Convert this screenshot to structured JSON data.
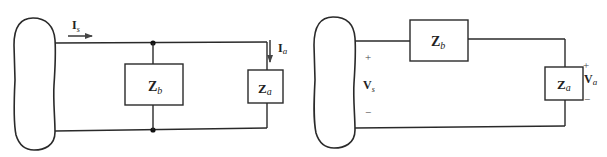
{
  "diagrams": [
    {
      "id": "parallel",
      "description": "Source network with parallel impedances Zb and Za",
      "components": {
        "zb": {
          "main": "Z",
          "sub": "b"
        },
        "za": {
          "main": "Z",
          "sub": "a"
        }
      },
      "currents": {
        "source": {
          "main": "I",
          "sub": "s"
        },
        "load": {
          "main": "I",
          "sub": "a"
        }
      }
    },
    {
      "id": "series",
      "description": "Source network with series impedance Zb and load Za",
      "components": {
        "zb": {
          "main": "Z",
          "sub": "b"
        },
        "za": {
          "main": "Z",
          "sub": "a"
        }
      },
      "voltages": {
        "source": {
          "main": "V",
          "sub": "s",
          "plus": "+",
          "minus": "−"
        },
        "load": {
          "main": "V",
          "sub": "a",
          "plus": "+",
          "minus": "−"
        }
      }
    }
  ],
  "colors": {
    "line": "#2a2a2a",
    "background": "#ffffff"
  }
}
